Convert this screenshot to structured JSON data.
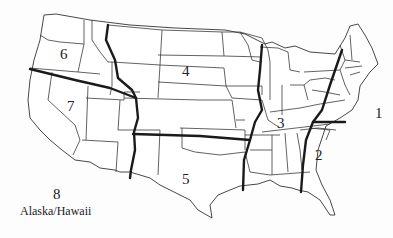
{
  "map": {
    "title": "United States regions map",
    "regions": [
      {
        "id": "1",
        "label": "1"
      },
      {
        "id": "2",
        "label": "2"
      },
      {
        "id": "3",
        "label": "3"
      },
      {
        "id": "4",
        "label": "4"
      },
      {
        "id": "5",
        "label": "5"
      },
      {
        "id": "6",
        "label": "6"
      },
      {
        "id": "7",
        "label": "7"
      },
      {
        "id": "8",
        "label": "8",
        "sublabel": "Alaska/Hawaii"
      }
    ],
    "colors": {
      "background": "#fdfdfd",
      "state_border": "#3a3a3a",
      "region_boundary": "#1a1a1a"
    }
  }
}
